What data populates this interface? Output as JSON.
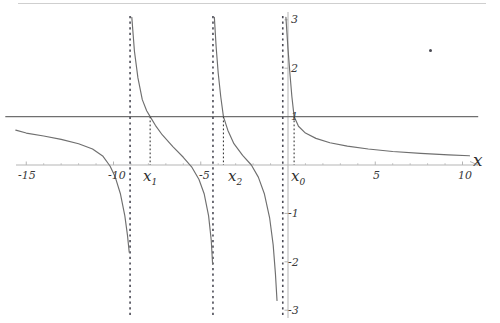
{
  "figure": {
    "axis_label_x": "x",
    "border_color": "#cfcfcf",
    "axis_color": "#b5b5b5",
    "curve_color": "#6f6f6f",
    "asymptote_color": "#4a4a55",
    "level_line_color": "#6f6f6f",
    "drop_line_color": "#3a3a3a"
  },
  "x_ticks": [
    {
      "label": "-15",
      "value": -15
    },
    {
      "label": "-10",
      "value": -10
    },
    {
      "label": "-5",
      "value": -5
    },
    {
      "label": "5",
      "value": 5
    },
    {
      "label": "10",
      "value": 10
    }
  ],
  "y_ticks": [
    {
      "label": "3",
      "value": 3
    },
    {
      "label": "2",
      "value": 2
    },
    {
      "label": "1",
      "value": 1
    },
    {
      "label": "-1",
      "value": -1
    },
    {
      "label": "-2",
      "value": -2
    },
    {
      "label": "-3",
      "value": -3
    }
  ],
  "solution_markers": [
    {
      "name": "x0",
      "base": "x",
      "sub": "0",
      "value": 0.35
    },
    {
      "name": "x1",
      "base": "x",
      "sub": "1",
      "value": -7.9
    },
    {
      "name": "x2",
      "base": "x",
      "sub": "2",
      "value": -3.7
    }
  ],
  "chart_data": {
    "type": "line",
    "title": "",
    "xlabel": "x",
    "ylabel": "",
    "xlim": [
      -16.5,
      11.2
    ],
    "ylim": [
      -3.2,
      3.2
    ],
    "grid": false,
    "legend": null,
    "series": [
      {
        "name": "curve",
        "description": "periodic cotangent-like branches with vertical asymptotes",
        "color": "#6f6f6f",
        "branches": [
          {
            "asymptote_left": -16.8,
            "asymptote_right": -9.05,
            "points": [
              [
                -15.6,
                0.72
              ],
              [
                -15.0,
                0.66
              ],
              [
                -14.0,
                0.6
              ],
              [
                -13.0,
                0.53
              ],
              [
                -12.0,
                0.44
              ],
              [
                -11.2,
                0.33
              ],
              [
                -10.6,
                0.18
              ],
              [
                -10.2,
                -0.02
              ],
              [
                -9.9,
                -0.25
              ],
              [
                -9.6,
                -0.6
              ],
              [
                -9.35,
                -1.05
              ],
              [
                -9.2,
                -1.45
              ],
              [
                -9.1,
                -1.8
              ]
            ]
          },
          {
            "asymptote_left": -9.05,
            "asymptote_right": -4.3,
            "points": [
              [
                -8.95,
                3.05
              ],
              [
                -8.8,
                2.35
              ],
              [
                -8.6,
                1.8
              ],
              [
                -8.35,
                1.35
              ],
              [
                -8.1,
                1.12
              ],
              [
                -7.9,
                1.0
              ],
              [
                -7.6,
                0.82
              ],
              [
                -7.2,
                0.62
              ],
              [
                -6.6,
                0.38
              ],
              [
                -6.0,
                0.16
              ],
              [
                -5.5,
                -0.05
              ],
              [
                -5.1,
                -0.3
              ],
              [
                -4.8,
                -0.6
              ],
              [
                -4.55,
                -1.05
              ],
              [
                -4.4,
                -1.55
              ],
              [
                -4.32,
                -2.05
              ]
            ]
          },
          {
            "asymptote_left": -4.3,
            "asymptote_right": -0.3,
            "points": [
              [
                -4.22,
                3.05
              ],
              [
                -4.12,
                2.45
              ],
              [
                -4.0,
                1.9
              ],
              [
                -3.85,
                1.4
              ],
              [
                -3.7,
                1.0
              ],
              [
                -3.45,
                0.72
              ],
              [
                -3.1,
                0.44
              ],
              [
                -2.6,
                0.2
              ],
              [
                -2.1,
                0.0
              ],
              [
                -1.7,
                -0.25
              ],
              [
                -1.35,
                -0.6
              ],
              [
                -1.05,
                -1.1
              ],
              [
                -0.85,
                -1.65
              ],
              [
                -0.72,
                -2.25
              ],
              [
                -0.63,
                -2.8
              ]
            ]
          },
          {
            "asymptote_left": -0.3,
            "asymptote_right": 11.5,
            "points": [
              [
                -0.12,
                3.05
              ],
              [
                0.0,
                2.4
              ],
              [
                0.12,
                1.85
              ],
              [
                0.22,
                1.42
              ],
              [
                0.35,
                1.0
              ],
              [
                0.6,
                0.8
              ],
              [
                1.0,
                0.66
              ],
              [
                1.6,
                0.55
              ],
              [
                2.4,
                0.46
              ],
              [
                3.4,
                0.39
              ],
              [
                4.6,
                0.33
              ],
              [
                6.0,
                0.28
              ],
              [
                7.6,
                0.24
              ],
              [
                9.2,
                0.21
              ],
              [
                10.4,
                0.19
              ]
            ]
          }
        ]
      },
      {
        "name": "level-line-y-equals-1",
        "description": "horizontal reference line at y = 1",
        "color": "#6f6f6f",
        "y": 1,
        "x_from": -16.2,
        "x_to": 10.9
      }
    ],
    "asymptotes": [
      -9.05,
      -4.3,
      -0.3
    ],
    "intersections": [
      {
        "label": "x0",
        "x": 0.35,
        "y": 1
      },
      {
        "label": "x1",
        "x": -7.9,
        "y": 1
      },
      {
        "label": "x2",
        "x": -3.7,
        "y": 1
      }
    ]
  }
}
